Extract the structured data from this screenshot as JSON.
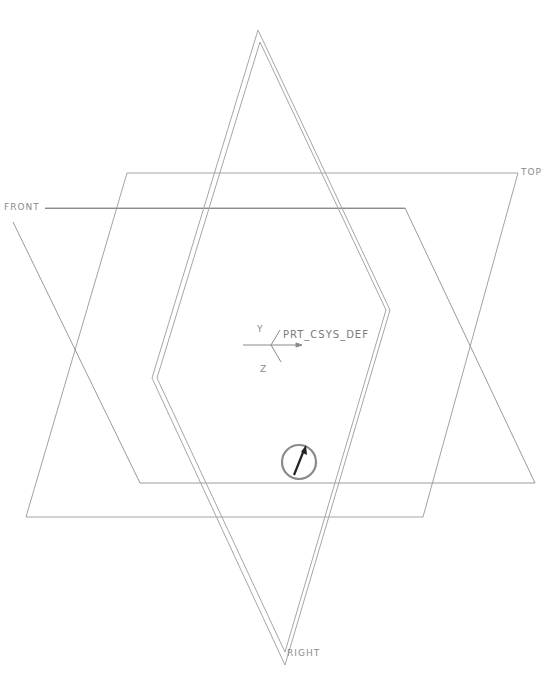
{
  "viewport": {
    "background": "#ffffff",
    "line_color": "#9a9a9a"
  },
  "datum_planes": {
    "front": {
      "label": "FRONT"
    },
    "top": {
      "label": "TOP"
    },
    "right": {
      "label": "RIGHT"
    }
  },
  "coordinate_system": {
    "label": "PRT_CSYS_DEF",
    "axis_y": "Y",
    "axis_z": "Z"
  },
  "spin_center": {
    "icon": "spin-center-icon",
    "color": "#8a8a8a"
  }
}
